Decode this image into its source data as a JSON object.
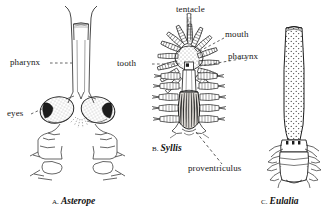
{
  "plate": {
    "background_color": "#ffffff",
    "ink_color": "#1a1a1a",
    "width": 323,
    "height": 216,
    "subject": "comparative pharynx anatomy line drawings"
  },
  "labels": {
    "pharynx_left": "pharynx",
    "eyes": "eyes",
    "tentacle": "tentacle",
    "mouth": "mouth",
    "tooth": "tooth",
    "pharynx_right": "pharynx",
    "proventriculus": "proventriculus"
  },
  "captions": {
    "a": {
      "letter": "A.",
      "genus": "Asterope"
    },
    "b": {
      "letter": "B.",
      "genus": "Syllis"
    },
    "c": {
      "letter": "C.",
      "genus": "Eulalia"
    }
  }
}
